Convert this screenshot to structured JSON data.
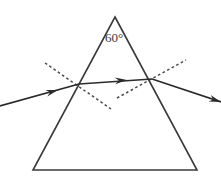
{
  "figure": {
    "background_color": "#ffffff",
    "stroke_color": "#2b2b2b",
    "prism_stroke_color": "#3a3a3a",
    "normal_stroke_color": "#4a4a4a",
    "width": 221,
    "height": 178
  },
  "labels": {
    "apex_angle": "60°"
  },
  "prism": {
    "name": "triangular-prism",
    "apex": {
      "x": 115,
      "y": 17
    },
    "bottom_left": {
      "x": 33,
      "y": 170
    },
    "bottom_right": {
      "x": 197,
      "y": 170
    },
    "points": "115,17 197,170 33,170"
  },
  "rays": {
    "incident": {
      "label": "incident-ray",
      "from": {
        "x": 0,
        "y": 106
      },
      "to": {
        "x": 79,
        "y": 84
      },
      "arrow_at": {
        "x": 58,
        "y": 90
      }
    },
    "internal": {
      "label": "refracted-internal-ray",
      "from": {
        "x": 79,
        "y": 84
      },
      "to": {
        "x": 152,
        "y": 79
      },
      "arrow_at": {
        "x": 127,
        "y": 80
      }
    },
    "emergent": {
      "label": "emergent-ray",
      "from": {
        "x": 152,
        "y": 79
      },
      "to": {
        "x": 221,
        "y": 102
      },
      "arrow_at": {
        "x": 218,
        "y": 101
      }
    }
  },
  "normals": {
    "entry": {
      "label": "normal-at-entry-face",
      "from": {
        "x": 45,
        "y": 63
      },
      "to": {
        "x": 111,
        "y": 109
      }
    },
    "exit": {
      "label": "normal-at-exit-face",
      "from": {
        "x": 117,
        "y": 98
      },
      "to": {
        "x": 186,
        "y": 60
      }
    }
  },
  "points": {
    "entry": {
      "x": 79,
      "y": 84
    },
    "exit": {
      "x": 152,
      "y": 79
    }
  },
  "angle_label_position": {
    "x": 105,
    "y": 42
  }
}
